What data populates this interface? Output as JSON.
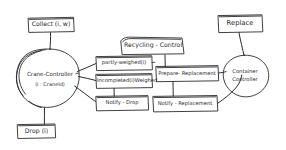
{
  "diagram": {
    "style": "hand-drawn whiteboard sketch, black ink on white",
    "ink_color": "#2b2b2b",
    "background_color": "#ffffff",
    "nodes": [
      {
        "id": "collect",
        "shape": "rectangle",
        "label": "Collect (i, w)",
        "x": 28,
        "y": 17,
        "w": 46,
        "h": 15
      },
      {
        "id": "crane-controller",
        "shape": "circle",
        "label": "Crane-Controller",
        "sublabel": "(i : CraneId)",
        "x": 14,
        "y": 48,
        "w": 72,
        "h": 60
      },
      {
        "id": "drop",
        "shape": "rectangle",
        "label": "Drop (i)",
        "x": 17,
        "y": 124,
        "w": 38,
        "h": 14
      },
      {
        "id": "recycling-control",
        "shape": "rectangle",
        "label": "Recycling - Control",
        "x": 122,
        "y": 37,
        "w": 62,
        "h": 16
      },
      {
        "id": "partly-weighed",
        "shape": "rectangle",
        "label": "partly-weighed(i)",
        "x": 96,
        "y": 56,
        "w": 56,
        "h": 14
      },
      {
        "id": "incompleted-weighed",
        "shape": "rectangle",
        "label": "Incompleted(i)Weighed",
        "x": 96,
        "y": 74,
        "w": 56,
        "h": 14
      },
      {
        "id": "notify-drop",
        "shape": "rectangle",
        "label": "Notify - Drop",
        "x": 96,
        "y": 96,
        "w": 52,
        "h": 14
      },
      {
        "id": "prepare-replacement",
        "shape": "rectangle",
        "label": "Prepare- Replacement",
        "x": 156,
        "y": 66,
        "w": 62,
        "h": 15
      },
      {
        "id": "notify-replacement",
        "shape": "rectangle",
        "label": "Notify - Replacement",
        "x": 153,
        "y": 96,
        "w": 64,
        "h": 15
      },
      {
        "id": "replace",
        "shape": "rectangle",
        "label": "Replace",
        "x": 218,
        "y": 15,
        "w": 44,
        "h": 17
      },
      {
        "id": "container-controller",
        "shape": "circle",
        "label": "Container",
        "sublabel": "Controller",
        "x": 222,
        "y": 55,
        "w": 46,
        "h": 44
      }
    ],
    "edges": [
      {
        "id": "edge-collect-crane",
        "from": "collect",
        "to": "crane-controller"
      },
      {
        "id": "edge-crane-drop",
        "from": "crane-controller",
        "to": "drop"
      },
      {
        "id": "edge-crane-partly-weighed",
        "from": "crane-controller",
        "to": "partly-weighed"
      },
      {
        "id": "edge-crane-incompleted-weighed",
        "from": "crane-controller",
        "to": "incompleted-weighed"
      },
      {
        "id": "edge-crane-notify-drop",
        "from": "crane-controller",
        "to": "notify-drop"
      },
      {
        "id": "edge-recycling-prepare",
        "from": "recycling-control",
        "to": "prepare-replacement"
      },
      {
        "id": "edge-prepare-notify-replacement",
        "from": "prepare-replacement",
        "to": "notify-replacement"
      },
      {
        "id": "edge-prepare-container",
        "from": "prepare-replacement",
        "to": "container-controller"
      },
      {
        "id": "edge-notify-replacement-container",
        "from": "notify-replacement",
        "to": "container-controller"
      },
      {
        "id": "edge-replace-container",
        "from": "replace",
        "to": "container-controller"
      }
    ]
  }
}
